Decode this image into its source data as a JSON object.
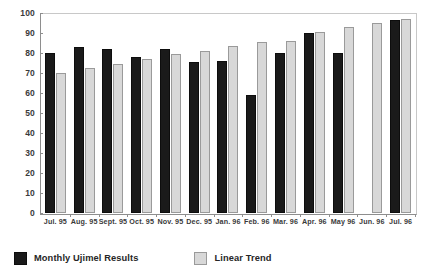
{
  "chart_data": {
    "type": "bar",
    "title": "",
    "subtitle": "",
    "xlabel": "",
    "ylabel": "",
    "ylim": [
      0,
      100
    ],
    "ytick_step": 10,
    "yticks": [
      "0",
      "10",
      "20",
      "30",
      "40",
      "50",
      "60",
      "70",
      "80",
      "90",
      "100"
    ],
    "grid": false,
    "legend_position": "bottom-left",
    "categories": [
      "Jul. 95",
      "Aug. 95",
      "Sept. 95",
      "Oct. 95",
      "Nov. 95",
      "Dec. 95",
      "Jan. 96",
      "Feb. 96",
      "Mar. 96",
      "Apr. 96",
      "May 96",
      "Jun. 96",
      "Jul. 96"
    ],
    "series": [
      {
        "name": "Monthly Ujimel Results",
        "color": "#1a1a1a",
        "values": [
          80,
          83,
          82,
          78,
          82,
          75.5,
          76,
          59,
          80,
          90,
          80,
          null,
          96.5
        ]
      },
      {
        "name": "Linear Trend",
        "color": "#d8d8d8",
        "values": [
          70,
          72.5,
          74.5,
          77,
          79.5,
          81,
          83.5,
          85.5,
          86,
          90.5,
          93,
          95,
          97
        ]
      }
    ]
  },
  "axis": {
    "y": {
      "ticks": [
        {
          "label": "100",
          "value": 100
        },
        {
          "label": "90",
          "value": 90
        },
        {
          "label": "80",
          "value": 80
        },
        {
          "label": "70",
          "value": 70
        },
        {
          "label": "60",
          "value": 60
        },
        {
          "label": "50",
          "value": 50
        },
        {
          "label": "40",
          "value": 40
        },
        {
          "label": "30",
          "value": 30
        },
        {
          "label": "20",
          "value": 20
        },
        {
          "label": "10",
          "value": 10
        },
        {
          "label": "0",
          "value": 0
        }
      ]
    }
  },
  "legend": {
    "entries": [
      {
        "label": "Monthly Ujimel Results",
        "swatch": "dark"
      },
      {
        "label": "Linear Trend",
        "swatch": "light"
      }
    ]
  },
  "colors": {
    "series_dark": "#1a1a1a",
    "series_light": "#d8d8d8",
    "axis": "#8e8e8e",
    "text": "#3a3a3a",
    "background": "#ffffff"
  }
}
